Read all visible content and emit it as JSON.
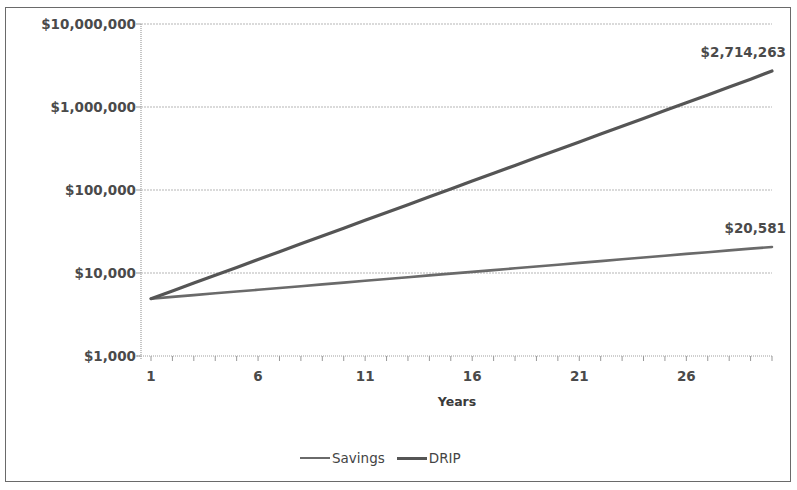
{
  "chart_data": {
    "type": "line",
    "title": "",
    "xlabel": "Years",
    "ylabel": "",
    "yscale": "log",
    "ylim": [
      1000,
      10000000
    ],
    "xlim": [
      1,
      30
    ],
    "grid": true,
    "legend_position": "bottom",
    "y_ticks": [
      "$10,000,000",
      "$1,000,000",
      "$100,000",
      "$10,000",
      "$1,000"
    ],
    "x_ticks": [
      "1",
      "6",
      "11",
      "16",
      "21",
      "26"
    ],
    "x": [
      1,
      2,
      3,
      4,
      5,
      6,
      7,
      8,
      9,
      10,
      11,
      12,
      13,
      14,
      15,
      16,
      17,
      18,
      19,
      20,
      21,
      22,
      23,
      24,
      25,
      26,
      27,
      28,
      29,
      30
    ],
    "series": [
      {
        "name": "Savings",
        "color": "#6a6a6a",
        "start_value": 4900,
        "end_value": 20581,
        "end_label": "$20,581",
        "values": [
          4900,
          5150,
          5412,
          5688,
          5978,
          6282,
          6602,
          6938,
          7291,
          7662,
          8053,
          8463,
          8894,
          9347,
          9822,
          10323,
          10848,
          11401,
          11981,
          12592,
          13233,
          13907,
          14615,
          15360,
          16142,
          16964,
          17828,
          18736,
          19690,
          20581
        ]
      },
      {
        "name": "DRIP",
        "color": "#555555",
        "start_value": 4900,
        "end_value": 2714263,
        "end_label": "$2,714,263",
        "values": [
          4900,
          6090,
          7569,
          9408,
          11693,
          14533,
          18063,
          22451,
          27905,
          34683,
          43107,
          53578,
          66592,
          82768,
          102872,
          127860,
          158917,
          197518,
          245496,
          305128,
          379245,
          471367,
          585865,
          728174,
          905049,
          1124888,
          1398126,
          1737737,
          2159841,
          2714263
        ]
      }
    ]
  },
  "legend": {
    "items": [
      {
        "label": "Savings"
      },
      {
        "label": "DRIP"
      }
    ]
  }
}
